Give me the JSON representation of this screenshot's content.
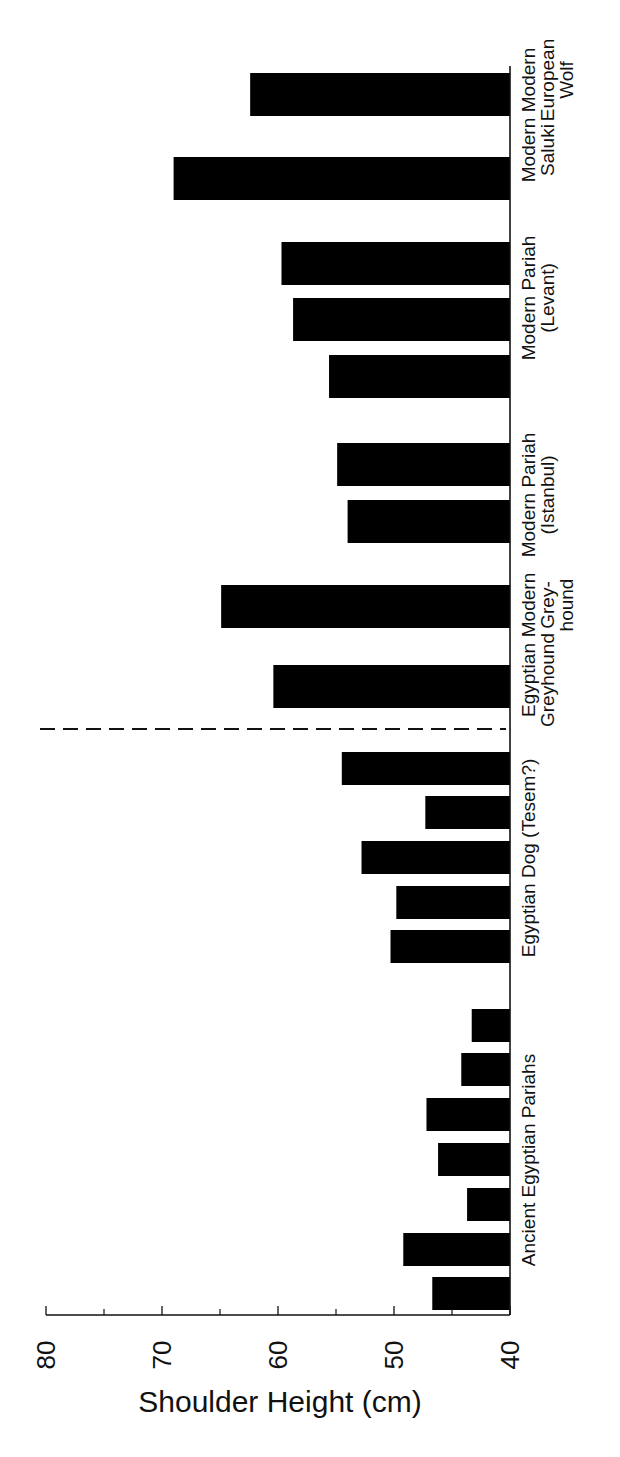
{
  "chart_data": {
    "type": "bar",
    "orientation": "horizontal-bars, figure rotated 90deg (text reads bottom-to-top)",
    "title": "",
    "xlabel": "",
    "ylabel": "Shoulder Height (cm)",
    "ylim": [
      40,
      80
    ],
    "ticks_major": [
      "80",
      "70",
      "60",
      "50",
      "40"
    ],
    "tick_values_major": [
      80,
      70,
      60,
      50,
      40
    ],
    "tick_values_minor": [
      75,
      65,
      55,
      45
    ],
    "grid": false,
    "legend": null,
    "separator": {
      "style": "dashed",
      "between": [
        "Egyptian Dog (Tesem?)",
        "Egyptian Greyhound"
      ]
    },
    "groups": [
      {
        "name": "Ancient Egyptian Pariahs",
        "label_lines": [
          "Ancient Egyptian Pariahs"
        ],
        "values": [
          46.7,
          49.2,
          43.7,
          46.2,
          47.2,
          44.2,
          43.3
        ]
      },
      {
        "name": "Egyptian Dog (Tesem?)",
        "label_lines": [
          "Egyptian Dog (Tesem?)"
        ],
        "values": [
          50.3,
          49.8,
          52.8,
          47.3,
          54.5
        ]
      },
      {
        "name": "Egyptian Greyhound",
        "label_lines": [
          "Egyptian",
          "Greyhound"
        ],
        "values": [
          60.4
        ]
      },
      {
        "name": "Modern Greyhound",
        "label_lines": [
          "Modern",
          "Grey-",
          "hound"
        ],
        "values": [
          64.9
        ]
      },
      {
        "name": "Modern Pariah (Istanbul)",
        "label_lines": [
          "Modern Pariah",
          "(Istanbul)"
        ],
        "values": [
          54.0,
          54.9
        ]
      },
      {
        "name": "Modern Pariah (Levant)",
        "label_lines": [
          "Modern Pariah",
          "(Levant)"
        ],
        "values": [
          55.6,
          58.7,
          59.7
        ]
      },
      {
        "name": "Modern Saluki",
        "label_lines": [
          "Modern",
          "Saluki"
        ],
        "values": [
          69.0
        ]
      },
      {
        "name": "Modern European Wolf",
        "label_lines": [
          "Modern",
          "European",
          "Wolf"
        ],
        "values": [
          62.4
        ]
      }
    ],
    "bar_color": "#000000"
  }
}
